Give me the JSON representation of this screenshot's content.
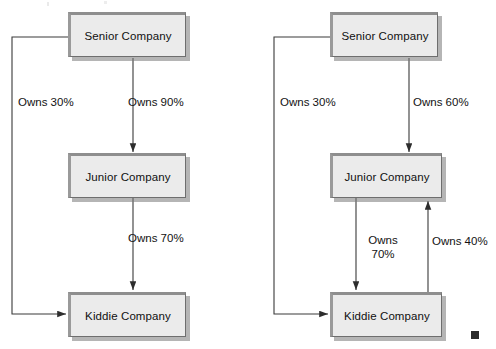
{
  "page": {
    "background_color": "#ffffff",
    "width": 496,
    "height": 349,
    "ink_color": "#121212",
    "box_fill_color": "#ebebeb",
    "box_shadow_color": "#787878",
    "marker_color": "#2b2b2b"
  },
  "diagrams": [
    {
      "id": "left-diagram",
      "name": "direct-and-indirect-ownership",
      "nodes": [
        {
          "id": "senior",
          "label": "Senior Company"
        },
        {
          "id": "junior",
          "label": "Junior Company"
        },
        {
          "id": "kiddie",
          "label": "Kiddie Company"
        }
      ],
      "edges": [
        {
          "id": "senior-to-kiddie",
          "from": "Senior Company",
          "to": "Kiddie Company",
          "label": "Owns 30%",
          "percent": 30,
          "route": "left-elbow"
        },
        {
          "id": "senior-to-junior",
          "from": "Senior Company",
          "to": "Junior Company",
          "label": "Owns 90%",
          "percent": 90,
          "route": "vertical"
        },
        {
          "id": "junior-to-kiddie",
          "from": "Junior Company",
          "to": "Kiddie Company",
          "label": "Owns 70%",
          "percent": 70,
          "route": "vertical"
        }
      ]
    },
    {
      "id": "right-diagram",
      "name": "reciprocal-ownership",
      "nodes": [
        {
          "id": "senior",
          "label": "Senior Company"
        },
        {
          "id": "junior",
          "label": "Junior Company"
        },
        {
          "id": "kiddie",
          "label": "Kiddie Company"
        }
      ],
      "edges": [
        {
          "id": "senior-to-kiddie",
          "from": "Senior Company",
          "to": "Kiddie Company",
          "label": "Owns 30%",
          "percent": 30,
          "route": "left-elbow"
        },
        {
          "id": "senior-to-junior",
          "from": "Senior Company",
          "to": "Junior Company",
          "label": "Owns 60%",
          "percent": 60,
          "route": "vertical"
        },
        {
          "id": "junior-to-kiddie",
          "from": "Junior Company",
          "to": "Kiddie Company",
          "label_line1": "Owns",
          "label_line2": "70%",
          "percent": 70,
          "route": "vertical-down"
        },
        {
          "id": "kiddie-to-junior",
          "from": "Kiddie Company",
          "to": "Junior Company",
          "label": "Owns 40%",
          "percent": 40,
          "route": "vertical-up"
        }
      ]
    }
  ],
  "marker": {
    "name": "end-of-figure-square"
  }
}
